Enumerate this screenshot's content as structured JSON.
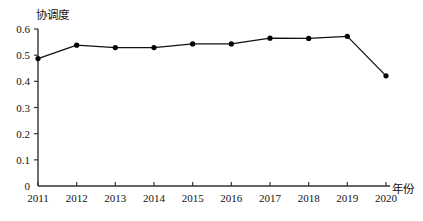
{
  "chart_data": {
    "type": "line",
    "title": "",
    "subtitle": "",
    "xlabel": "年份",
    "ylabel": "协调度",
    "categories": [
      "2011",
      "2012",
      "2013",
      "2014",
      "2015",
      "2016",
      "2017",
      "2018",
      "2019",
      "2020"
    ],
    "values": [
      0.487,
      0.538,
      0.529,
      0.529,
      0.543,
      0.543,
      0.565,
      0.564,
      0.572,
      0.421
    ],
    "series": [
      {
        "name": "协调度",
        "values": [
          0.487,
          0.538,
          0.529,
          0.529,
          0.543,
          0.543,
          0.565,
          0.564,
          0.572,
          0.421
        ]
      }
    ],
    "xlim": [
      2011,
      2020
    ],
    "ylim": [
      0,
      0.6
    ],
    "ytick_labels": [
      "0",
      "0.1",
      "0.2",
      "0.3",
      "0.4",
      "0.5",
      "0.6"
    ],
    "ytick_values": [
      0,
      0.1,
      0.2,
      0.3,
      0.4,
      0.5,
      0.6
    ],
    "xtick_labels": [
      "2011",
      "2012",
      "2013",
      "2014",
      "2015",
      "2016",
      "2017",
      "2018",
      "2019",
      "2020"
    ],
    "grid": false,
    "legend": false,
    "legend_position": "none",
    "annotations": [],
    "line_color": "#111111",
    "marker_color": "#000000",
    "marker_shape": "circle",
    "axis_color": "#333333",
    "background_color": "#ffffff"
  }
}
